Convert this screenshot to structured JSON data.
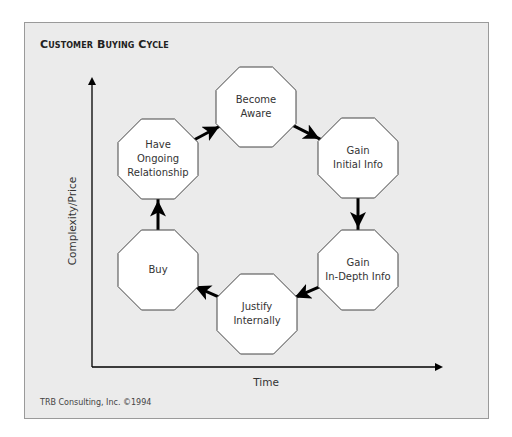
{
  "title": "Customer Buying Cycle",
  "axes": {
    "y_label": "Complexity/Price",
    "x_label": "Time"
  },
  "nodes": [
    {
      "id": "become-aware",
      "label": "Become Aware",
      "lines": [
        "Become",
        "Aware"
      ],
      "cx": 256,
      "cy": 107
    },
    {
      "id": "gain-initial-info",
      "label": "Gain Initial Info",
      "lines": [
        "Gain",
        "Initial Info"
      ],
      "cx": 358,
      "cy": 158
    },
    {
      "id": "gain-in-depth-info",
      "label": "Gain In-Depth Info",
      "lines": [
        "Gain",
        "In-Depth Info"
      ],
      "cx": 358,
      "cy": 270
    },
    {
      "id": "justify-internally",
      "label": "Justify Internally",
      "lines": [
        "Justify",
        "Internally"
      ],
      "cx": 257,
      "cy": 314
    },
    {
      "id": "buy",
      "label": "Buy",
      "lines": [
        "Buy"
      ],
      "cx": 158,
      "cy": 270
    },
    {
      "id": "have-ongoing-relationship",
      "label": "Have Ongoing Relationship",
      "lines": [
        "Have",
        "Ongoing",
        "Relationship"
      ],
      "cx": 158,
      "cy": 159
    }
  ],
  "edges": [
    {
      "from": "become-aware",
      "to": "gain-initial-info"
    },
    {
      "from": "gain-initial-info",
      "to": "gain-in-depth-info"
    },
    {
      "from": "gain-in-depth-info",
      "to": "justify-internally"
    },
    {
      "from": "justify-internally",
      "to": "buy"
    },
    {
      "from": "buy",
      "to": "have-ongoing-relationship"
    },
    {
      "from": "have-ongoing-relationship",
      "to": "become-aware"
    }
  ],
  "credit": "TRB Consulting, Inc. ©1994",
  "colors": {
    "frame_bg": "#ebebeb",
    "frame_border": "#9a9a9a",
    "node_fill": "#ffffff",
    "node_stroke": "#444444",
    "arrow": "#000000"
  }
}
